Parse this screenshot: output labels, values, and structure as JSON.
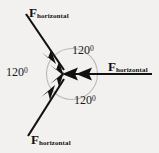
{
  "figure": {
    "background_color": "#f2f1f0",
    "stroke_color": "#111111",
    "circle_color": "#b9b6b3"
  },
  "center": {
    "x": 72,
    "y": 74
  },
  "vectors": [
    {
      "id": "upper-left",
      "label_base": "F",
      "label_sub": "horizontal",
      "direction_deg": 240,
      "points_toward_center": true,
      "arrowheads": 2
    },
    {
      "id": "right",
      "label_base": "F",
      "label_sub": "horizontal",
      "direction_deg": 0,
      "points_toward_center": true,
      "arrowheads": 2
    },
    {
      "id": "lower-left",
      "label_base": "F",
      "label_sub": "horizontal",
      "direction_deg": 120,
      "points_toward_center": true,
      "arrowheads": 2
    }
  ],
  "angles": [
    {
      "id": "angle-top",
      "value": "120",
      "degree_symbol": "0"
    },
    {
      "id": "angle-left",
      "value": "120",
      "degree_symbol": "0"
    },
    {
      "id": "angle-bottom",
      "value": "120",
      "degree_symbol": "0"
    }
  ]
}
